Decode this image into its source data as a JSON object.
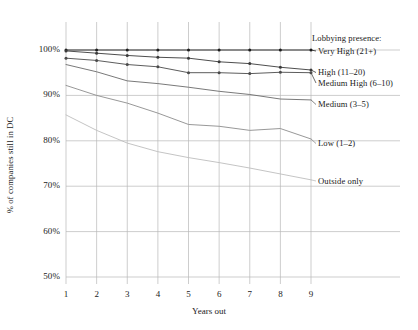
{
  "chart_data": {
    "type": "line",
    "title": "",
    "xlabel": "Years out",
    "ylabel": "% of companies still in DC",
    "x": [
      1,
      2,
      3,
      4,
      5,
      6,
      7,
      8,
      9
    ],
    "xtick_labels": [
      "1",
      "2",
      "3",
      "4",
      "5",
      "6",
      "7",
      "8",
      "9"
    ],
    "ytick_labels": [
      "50%",
      "60%",
      "70%",
      "80%",
      "90%",
      "100%"
    ],
    "yticks": [
      50,
      60,
      70,
      80,
      90,
      100
    ],
    "ylim": [
      50,
      100
    ],
    "xlim": [
      1,
      9
    ],
    "grid": true,
    "legend_position": "right-inline",
    "legend_heading": "Lobbying presence:",
    "series": [
      {
        "name": "Very High (21+)",
        "color": "#1c1c1c",
        "markers": true,
        "values": [
          100.0,
          100.0,
          100.0,
          100.0,
          100.0,
          100.0,
          100.0,
          100.0,
          100.0
        ]
      },
      {
        "name": "High (11–20)",
        "color": "#3a3a3a",
        "markers": true,
        "values": [
          99.8,
          99.3,
          98.8,
          98.4,
          98.2,
          97.4,
          97.0,
          96.2,
          95.6
        ]
      },
      {
        "name": "Medium High (6–10)",
        "color": "#4a4a4a",
        "markers": true,
        "values": [
          98.2,
          97.7,
          96.8,
          96.3,
          95.0,
          95.0,
          94.8,
          95.1,
          95.0
        ]
      },
      {
        "name": "Medium (3–5)",
        "color": "#6a6a6a",
        "markers": false,
        "values": [
          96.8,
          95.2,
          93.2,
          92.6,
          91.8,
          90.9,
          90.2,
          89.2,
          89.0
        ]
      },
      {
        "name": "Low (1–2)",
        "color": "#8c8c8c",
        "markers": false,
        "values": [
          92.2,
          90.0,
          88.3,
          86.1,
          83.6,
          83.2,
          82.3,
          82.7,
          80.4
        ]
      },
      {
        "name": "Outside only",
        "color": "#bdbdbd",
        "markers": false,
        "values": [
          85.7,
          82.3,
          79.5,
          77.6,
          76.3,
          75.2,
          74.0,
          72.7,
          71.4
        ]
      }
    ]
  },
  "legend": {
    "heading": "Lobbying presence:",
    "items": [
      {
        "label": "Very High (21+)"
      },
      {
        "label": "High (11–20)"
      },
      {
        "label": "Medium High (6–10)"
      },
      {
        "label": "Medium (3–5)"
      },
      {
        "label": "Low (1–2)"
      },
      {
        "label": "Outside only"
      }
    ]
  },
  "colors": {
    "grid": "#b8b8b8",
    "text": "#1a1a1a",
    "background": "#ffffff"
  }
}
